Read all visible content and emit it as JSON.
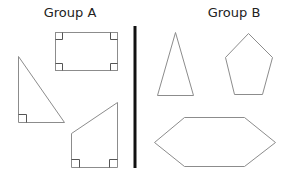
{
  "groups": [
    {
      "title": "Group A",
      "shapes": [
        {
          "name": "rectangle",
          "right_angles": 4
        },
        {
          "name": "right triangle",
          "right_angles": 1
        },
        {
          "name": "right trapezoid",
          "right_angles": 2
        }
      ]
    },
    {
      "title": "Group B",
      "shapes": [
        {
          "name": "isosceles triangle",
          "right_angles": 0
        },
        {
          "name": "pentagon",
          "right_angles": 0
        },
        {
          "name": "hexagon",
          "right_angles": 0
        }
      ]
    }
  ],
  "colors": {
    "shape_stroke": "#8c8c8c",
    "right_angle_mark": "#555555",
    "divider": "#111111",
    "background": "#ffffff"
  }
}
